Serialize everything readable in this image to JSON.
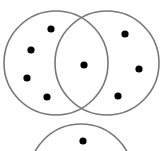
{
  "diagram": {
    "type": "venn",
    "circle_stroke": "#777777",
    "dot_color": "#000000",
    "background": "#ffffff",
    "circles": [
      {
        "name": "left",
        "cx": 56,
        "cy": 63,
        "r": 52
      },
      {
        "name": "right",
        "cx": 107,
        "cy": 63,
        "r": 52
      },
      {
        "name": "bottom",
        "cx": 81,
        "cy": 176,
        "r": 52
      }
    ],
    "dots": [
      {
        "region": "left-only",
        "x": 51,
        "y": 29
      },
      {
        "region": "left-only",
        "x": 31,
        "y": 50
      },
      {
        "region": "left-only",
        "x": 27,
        "y": 78
      },
      {
        "region": "left-only",
        "x": 47,
        "y": 97
      },
      {
        "region": "left-right-intersection",
        "x": 84,
        "y": 65
      },
      {
        "region": "right-only",
        "x": 125,
        "y": 34
      },
      {
        "region": "right-only",
        "x": 139,
        "y": 69
      },
      {
        "region": "right-only",
        "x": 118,
        "y": 96
      },
      {
        "region": "bottom-only",
        "x": 83,
        "y": 141
      }
    ]
  }
}
